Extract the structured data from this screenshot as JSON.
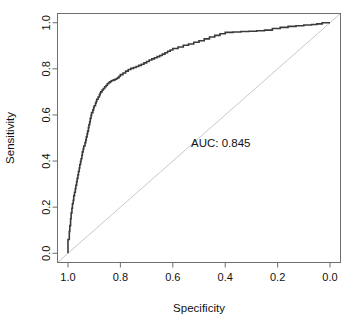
{
  "figure": {
    "type": "roc-curve",
    "background_color": "#ffffff"
  },
  "axes": {
    "x": {
      "label": "Specificity",
      "ticks": [
        "1.0",
        "0.8",
        "0.6",
        "0.4",
        "0.2",
        "0.0"
      ],
      "tick_values": [
        1.0,
        0.8,
        0.6,
        0.4,
        0.2,
        0.0
      ],
      "range": [
        1.04,
        -0.04
      ],
      "reversed": true
    },
    "y": {
      "label": "Sensitivity",
      "ticks": [
        "0.0",
        "0.2",
        "0.4",
        "0.6",
        "0.8",
        "1.0"
      ],
      "tick_values": [
        0.0,
        0.2,
        0.4,
        0.6,
        0.8,
        1.0
      ],
      "range": [
        -0.04,
        1.04
      ],
      "rotated_label": true
    }
  },
  "annotations": {
    "auc_text": "AUC: 0.845"
  },
  "colors": {
    "curve": "#3a3a3a",
    "chance_line": "#c9c9c9",
    "box": "#6e6e6e",
    "tick": "#6e6e6e",
    "text": "#111111"
  },
  "chart_data": {
    "type": "line",
    "title": "",
    "xlabel": "Specificity",
    "ylabel": "Sensitivity",
    "xlim": [
      1.04,
      -0.04
    ],
    "ylim": [
      -0.04,
      1.04
    ],
    "grid": false,
    "legend": "none",
    "annotations": [
      {
        "text": "AUC: 0.845",
        "x": 0.52,
        "y": 0.5
      }
    ],
    "auc": 0.845,
    "series": [
      {
        "name": "ROC curve",
        "style": "step",
        "color": "#3a3a3a",
        "x": [
          1.0,
          1.0,
          0.995,
          0.993,
          0.99,
          0.988,
          0.985,
          0.983,
          0.98,
          0.978,
          0.975,
          0.972,
          0.97,
          0.967,
          0.965,
          0.962,
          0.96,
          0.957,
          0.955,
          0.952,
          0.95,
          0.947,
          0.945,
          0.942,
          0.94,
          0.935,
          0.932,
          0.93,
          0.927,
          0.925,
          0.922,
          0.92,
          0.917,
          0.915,
          0.912,
          0.91,
          0.905,
          0.902,
          0.9,
          0.895,
          0.892,
          0.89,
          0.885,
          0.88,
          0.877,
          0.875,
          0.87,
          0.865,
          0.86,
          0.855,
          0.85,
          0.845,
          0.84,
          0.835,
          0.83,
          0.825,
          0.82,
          0.815,
          0.81,
          0.805,
          0.8,
          0.79,
          0.78,
          0.77,
          0.76,
          0.75,
          0.74,
          0.73,
          0.72,
          0.71,
          0.7,
          0.69,
          0.68,
          0.67,
          0.66,
          0.65,
          0.64,
          0.63,
          0.62,
          0.61,
          0.6,
          0.58,
          0.56,
          0.54,
          0.52,
          0.5,
          0.48,
          0.46,
          0.44,
          0.42,
          0.4,
          0.37,
          0.34,
          0.31,
          0.28,
          0.25,
          0.22,
          0.19,
          0.16,
          0.13,
          0.1,
          0.07,
          0.05,
          0.03,
          0.01,
          0.0
        ],
        "y": [
          0.0,
          0.06,
          0.095,
          0.12,
          0.15,
          0.175,
          0.195,
          0.215,
          0.23,
          0.25,
          0.265,
          0.28,
          0.295,
          0.31,
          0.325,
          0.34,
          0.355,
          0.37,
          0.385,
          0.398,
          0.41,
          0.425,
          0.44,
          0.452,
          0.465,
          0.48,
          0.492,
          0.505,
          0.518,
          0.53,
          0.545,
          0.558,
          0.57,
          0.585,
          0.598,
          0.61,
          0.622,
          0.632,
          0.64,
          0.652,
          0.66,
          0.668,
          0.678,
          0.688,
          0.695,
          0.7,
          0.708,
          0.715,
          0.722,
          0.728,
          0.735,
          0.74,
          0.744,
          0.748,
          0.75,
          0.752,
          0.755,
          0.758,
          0.762,
          0.768,
          0.775,
          0.782,
          0.79,
          0.797,
          0.802,
          0.806,
          0.81,
          0.815,
          0.82,
          0.826,
          0.832,
          0.838,
          0.843,
          0.848,
          0.853,
          0.858,
          0.864,
          0.87,
          0.876,
          0.882,
          0.888,
          0.895,
          0.902,
          0.908,
          0.915,
          0.922,
          0.93,
          0.938,
          0.945,
          0.952,
          0.958,
          0.96,
          0.962,
          0.963,
          0.965,
          0.968,
          0.975,
          0.98,
          0.984,
          0.987,
          0.99,
          0.992,
          0.995,
          1.0,
          1.0,
          1.0
        ]
      },
      {
        "name": "Chance line",
        "style": "diagonal",
        "color": "#c9c9c9",
        "x": [
          1.0,
          0.0
        ],
        "y": [
          0.0,
          1.0
        ]
      }
    ]
  }
}
